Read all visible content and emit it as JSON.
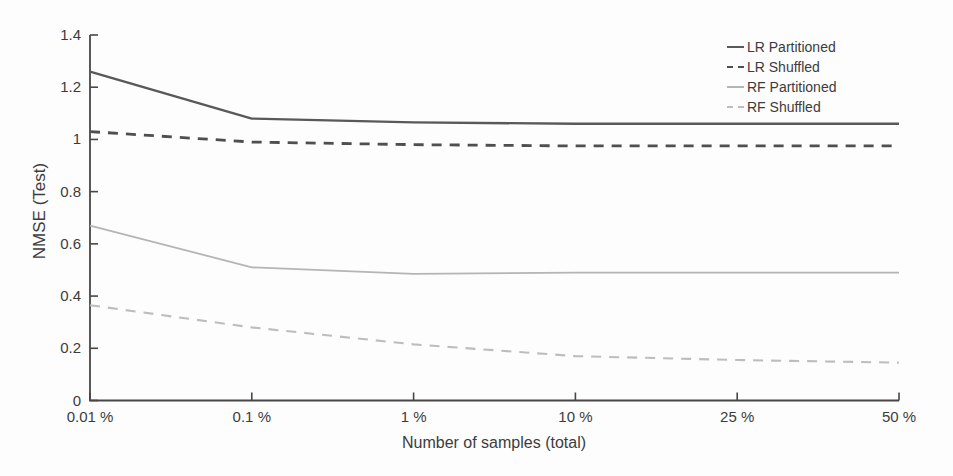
{
  "figure": {
    "background": "#fdfdfd",
    "axis_color": "#474747",
    "text_color": "#3c3c3c"
  },
  "chart_data": {
    "type": "line",
    "title": "",
    "xlabel": "Number of samples (total)",
    "ylabel": "NMSE (Test)",
    "categories": [
      "0.01 %",
      "0.1 %",
      "1 %",
      "10 %",
      "25 %",
      "50 %"
    ],
    "x_axis_note": "log-like percentage scale, tick positions equally spaced",
    "ylim": [
      0,
      1.4
    ],
    "y_ticks": [
      0,
      0.2,
      0.4,
      0.6,
      0.8,
      1,
      1.2,
      1.4
    ],
    "y_tick_labels": [
      "0",
      "0.2",
      "0.4",
      "0.6",
      "0.8",
      "1",
      "1.2",
      "1.4"
    ],
    "grid": false,
    "legend_position": "top-right",
    "series": [
      {
        "name": "LR Partitioned",
        "style": "solid",
        "color": "#595959",
        "width": 2.3,
        "values": [
          1.26,
          1.08,
          1.065,
          1.06,
          1.06,
          1.06
        ]
      },
      {
        "name": "LR Shuffled",
        "style": "dashed",
        "color": "#4f4f4f",
        "width": 2.8,
        "values": [
          1.03,
          0.99,
          0.98,
          0.975,
          0.975,
          0.975
        ]
      },
      {
        "name": "RF Partitioned",
        "style": "solid",
        "color": "#b5b5b5",
        "width": 1.8,
        "values": [
          0.67,
          0.51,
          0.485,
          0.49,
          0.49,
          0.49
        ]
      },
      {
        "name": "RF Shuffled",
        "style": "dashed",
        "color": "#bdbdbd",
        "width": 2.1,
        "values": [
          0.365,
          0.28,
          0.215,
          0.17,
          0.155,
          0.145
        ]
      }
    ]
  }
}
